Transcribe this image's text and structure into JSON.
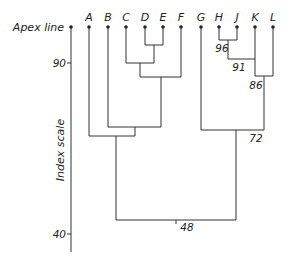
{
  "axis": {
    "apex_label": "Apex line",
    "scale_label": "Index scale",
    "ticks": [
      {
        "label": "90",
        "y": 63
      },
      {
        "label": "40",
        "y": 234
      }
    ]
  },
  "leaves": [
    {
      "label": "A",
      "x": 89
    },
    {
      "label": "B",
      "x": 108
    },
    {
      "label": "C",
      "x": 126
    },
    {
      "label": "D",
      "x": 145
    },
    {
      "label": "E",
      "x": 163
    },
    {
      "label": "F",
      "x": 181
    },
    {
      "label": "G",
      "x": 201
    },
    {
      "label": "H",
      "x": 219
    },
    {
      "label": "J",
      "x": 237
    },
    {
      "label": "K",
      "x": 255
    },
    {
      "label": "L",
      "x": 273
    }
  ],
  "node_labels": {
    "hj": "96",
    "hjk": "91",
    "hjkl": "86",
    "ghjkl": "72",
    "root": "48"
  }
}
